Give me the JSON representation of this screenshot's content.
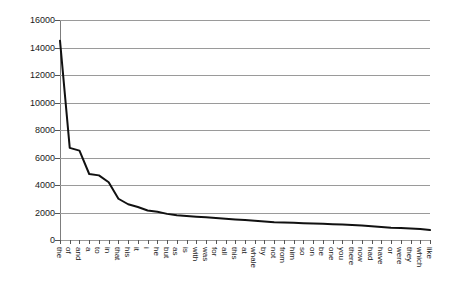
{
  "chart_data": {
    "type": "line",
    "title": "",
    "subtitle": "",
    "xlabel": "",
    "ylabel": "",
    "grid": true,
    "legend": false,
    "legend_position": "none",
    "ylim": [
      0,
      16000
    ],
    "y_ticks": [
      0,
      2000,
      4000,
      6000,
      8000,
      10000,
      12000,
      14000,
      16000
    ],
    "y_tick_labels": [
      "0",
      "2000",
      "4000",
      "6000",
      "8000",
      "10000",
      "12000",
      "14000",
      "16000"
    ],
    "categories": [
      "the",
      "of",
      "and",
      "a",
      "to",
      "in",
      "that",
      "his",
      "it",
      "i",
      "he",
      "but",
      "as",
      "is",
      "with",
      "was",
      "for",
      "all",
      "this",
      "at",
      "whale",
      "by",
      "not",
      "from",
      "him",
      "so",
      "on",
      "be",
      "one",
      "you",
      "there",
      "now",
      "had",
      "have",
      "or",
      "were",
      "they",
      "which",
      "like"
    ],
    "series": [
      {
        "name": "word frequency",
        "color": "#111111",
        "values": [
          14500,
          6700,
          6500,
          4800,
          4700,
          4200,
          3000,
          2600,
          2400,
          2150,
          2050,
          1900,
          1800,
          1750,
          1700,
          1650,
          1600,
          1550,
          1500,
          1450,
          1400,
          1350,
          1300,
          1280,
          1250,
          1220,
          1200,
          1180,
          1150,
          1120,
          1100,
          1050,
          1000,
          950,
          900,
          870,
          840,
          800,
          720
        ]
      }
    ]
  }
}
